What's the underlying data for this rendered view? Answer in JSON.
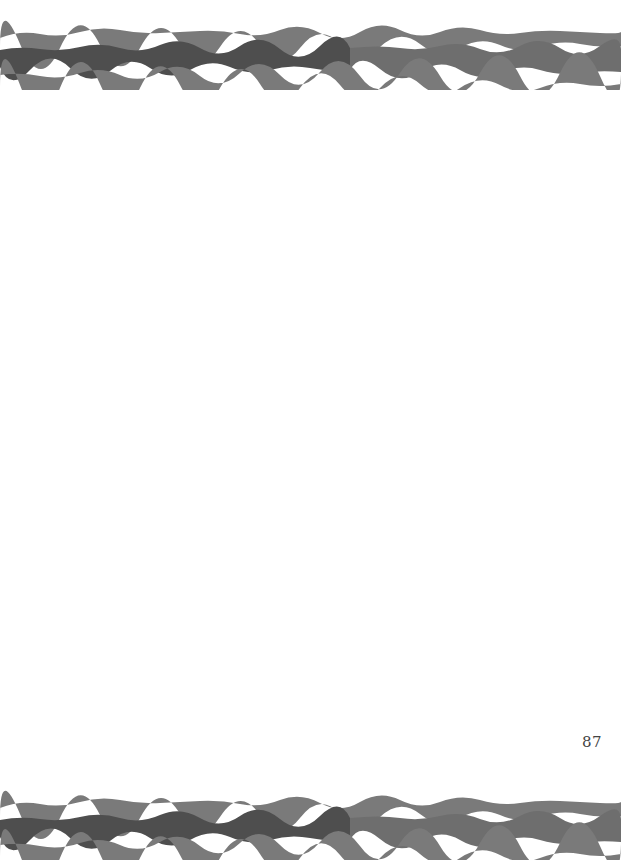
{
  "page": {
    "number": "87",
    "background": "#ffffff"
  },
  "borders": {
    "top": {
      "style": "wavy-watercolor-stripes",
      "stripe_colors": {
        "outer": "#7a7a7a",
        "inner_dark": "#4e4e4e",
        "inner_light": "#6e6e6e",
        "gap": "#f2f2f2"
      }
    },
    "bottom": {
      "style": "wavy-watercolor-stripes",
      "stripe_colors": {
        "outer": "#7a7a7a",
        "inner_dark": "#4e4e4e",
        "inner_light": "#6e6e6e",
        "gap": "#f2f2f2"
      }
    }
  }
}
